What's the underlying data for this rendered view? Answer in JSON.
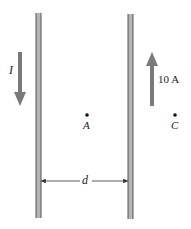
{
  "diagram": {
    "wires": [
      {
        "id": "left-wire",
        "x": 38,
        "y1": 13,
        "y2": 218
      },
      {
        "id": "right-wire",
        "x": 130,
        "y1": 14,
        "y2": 219
      }
    ],
    "currents": [
      {
        "id": "left-current",
        "label": "I",
        "direction": "down",
        "x": 20,
        "y1": 52,
        "y2": 105
      },
      {
        "id": "right-current",
        "label": "10 A",
        "direction": "up",
        "x": 152,
        "y1": 52,
        "y2": 105
      }
    ],
    "points": [
      {
        "id": "A",
        "label": "A",
        "x": 87,
        "y": 115
      },
      {
        "id": "C",
        "label": "C",
        "x": 175,
        "y": 115
      }
    ],
    "dimension": {
      "label": "d",
      "y": 181,
      "x1": 40,
      "x2": 128
    },
    "colors": {
      "wire": "#9a9a9a",
      "wire_edge": "#555555",
      "arrow": "#7a7a7a",
      "text": "#222222"
    }
  }
}
